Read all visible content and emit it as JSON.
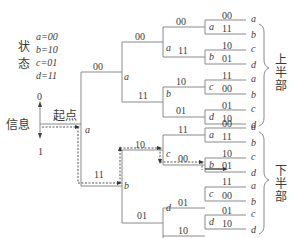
{
  "legend": {
    "title_chars": [
      "状",
      "态"
    ],
    "states": [
      "a=00",
      "b=10",
      "c=01",
      "d=11"
    ]
  },
  "input_axis": {
    "top_label": "0",
    "bottom_label": "1",
    "info_label": "信息",
    "start_label": "起点"
  },
  "root": {
    "state": "a"
  },
  "level1": {
    "upper": {
      "output": "00",
      "state": "a"
    },
    "lower": {
      "output": "11",
      "state": "b"
    }
  },
  "level2": {
    "upper_a": {
      "upper_output": "00",
      "lower_output": "11"
    },
    "lower_b": {
      "upper_output": "10",
      "lower_output": "01"
    },
    "states": {
      "ua_up": "a",
      "ua_lo": "b",
      "lb_up": "c",
      "lb_lo": "d"
    }
  },
  "upper_half": {
    "label_chars": [
      "上",
      "半",
      "部"
    ],
    "leaves": [
      {
        "node": "a",
        "outputs": [
          "00",
          "11"
        ],
        "targets": [
          "a",
          "b"
        ]
      },
      {
        "node": "b",
        "outputs": [
          "10",
          "01"
        ],
        "targets": [
          "c",
          "d"
        ]
      },
      {
        "node": "c",
        "outputs": [
          "11",
          "00"
        ],
        "targets": [
          "a",
          "b"
        ]
      },
      {
        "node": "d",
        "outputs": [
          "01",
          "10"
        ],
        "targets": [
          "c",
          "d"
        ]
      }
    ],
    "level3": {
      "a_up": "00",
      "a_lo": "11",
      "b_up": "10",
      "b_lo": "01"
    }
  },
  "lower_half": {
    "label_chars": [
      "下",
      "半",
      "部"
    ],
    "leaves": [
      {
        "node": "a",
        "outputs": [
          "00",
          "11"
        ],
        "targets": [
          "a",
          "b"
        ]
      },
      {
        "node": "b",
        "outputs": [
          "10",
          "01"
        ],
        "targets": [
          "c",
          "d"
        ]
      },
      {
        "node": "c",
        "outputs": [
          "11",
          "00"
        ],
        "targets": [
          "a",
          "b"
        ]
      },
      {
        "node": "d",
        "outputs": [
          "01",
          "10"
        ],
        "targets": [
          "c",
          "d"
        ]
      }
    ],
    "level3": {
      "c_up": "11",
      "c_lo": "00",
      "d_up": "01",
      "d_lo": "10"
    }
  },
  "colors": {
    "line": "#8a8a8a",
    "path": "#444444",
    "text": "#3a3a3a"
  }
}
